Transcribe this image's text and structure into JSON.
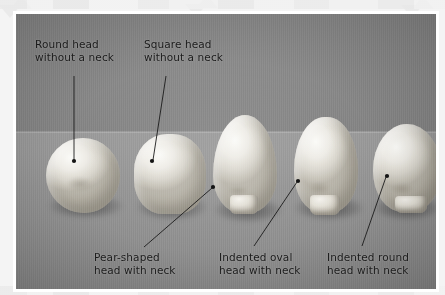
{
  "figure": {
    "type": "photograph-with-callouts",
    "frame_color": "#ffffff",
    "page_background": "#f4f4f4",
    "caption_color": "#1a1a1a",
    "leader_color": "#1b1b1b"
  },
  "callouts": [
    {
      "id": "round-head",
      "label": "Round head\nwithout a neck",
      "line1": "Round head",
      "line2": "without a neck",
      "position": "top-left",
      "points_to": "specimen-1"
    },
    {
      "id": "square-head",
      "label": "Square head\nwithout a neck",
      "line1": "Square head",
      "line2": "without a neck",
      "position": "top-center-left",
      "points_to": "specimen-2"
    },
    {
      "id": "pear-shaped-head",
      "label": "Pear-shaped\nhead with neck",
      "line1": "Pear-shaped",
      "line2": "head with neck",
      "position": "bottom-left",
      "points_to": "specimen-3"
    },
    {
      "id": "indented-oval-head",
      "label": "Indented oval\nhead with neck",
      "line1": "Indented oval",
      "line2": "head with neck",
      "position": "bottom-center",
      "points_to": "specimen-4"
    },
    {
      "id": "indented-round-head",
      "label": "Indented round\nhead with neck",
      "line1": "Indented round",
      "line2": "head with neck",
      "position": "bottom-right",
      "points_to": "specimen-5"
    }
  ],
  "specimens": [
    {
      "id": "specimen-1",
      "name": "round-head-specimen",
      "shape": "round",
      "has_neck": false
    },
    {
      "id": "specimen-2",
      "name": "square-head-specimen",
      "shape": "square",
      "has_neck": false
    },
    {
      "id": "specimen-3",
      "name": "pear-shaped-head-specimen",
      "shape": "pear",
      "has_neck": true
    },
    {
      "id": "specimen-4",
      "name": "indented-oval-head-specimen",
      "shape": "indented-oval",
      "has_neck": true
    },
    {
      "id": "specimen-5",
      "name": "indented-round-head-specimen",
      "shape": "indented-round",
      "has_neck": true
    }
  ]
}
